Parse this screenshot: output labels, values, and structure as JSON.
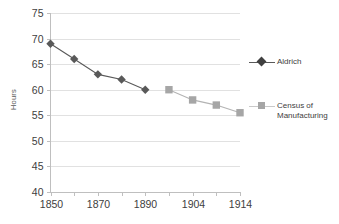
{
  "chart_data": {
    "type": "line",
    "title": "",
    "xlabel": "",
    "ylabel": "Hours",
    "ylim": [
      40,
      75
    ],
    "ytick_values": [
      40,
      45,
      50,
      55,
      60,
      65,
      70,
      75
    ],
    "ytick_labels": [
      "40",
      "45",
      "50",
      "55",
      "60",
      "65",
      "70",
      "75"
    ],
    "grid": true,
    "legend_position": "right",
    "x": [
      1850,
      1860,
      1870,
      1880,
      1890,
      1900,
      1904,
      1910,
      1914
    ],
    "xtick_labels": [
      "1850",
      "",
      "1870",
      "",
      "1890",
      "",
      "1904",
      "",
      "1914"
    ],
    "xtick_labels_visible": [
      "1850",
      "1870",
      "1890",
      "1904",
      "1914"
    ],
    "series": [
      {
        "name": "Aldrich",
        "color": "#595959",
        "marker": "diamond",
        "x": [
          1850,
          1860,
          1870,
          1880,
          1890
        ],
        "values": [
          69,
          66,
          63,
          62,
          60
        ]
      },
      {
        "name": "Census of Manufacturing",
        "legend_label": "Census of\nManufacturing",
        "color": "#a6a6a6",
        "marker": "square",
        "x": [
          1900,
          1904,
          1910,
          1914
        ],
        "values": [
          60,
          58,
          57,
          55.5
        ]
      }
    ]
  }
}
